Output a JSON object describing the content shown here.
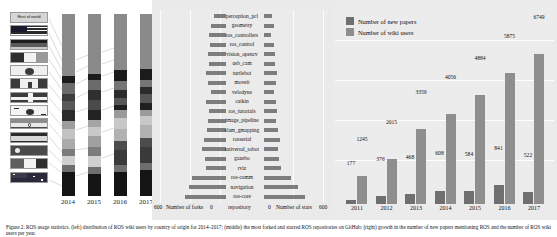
{
  "figure": {
    "caption": "Figure 2.    ROS usage statistics.    (left) distribution of ROS wiki users by country of origin for 2014–2017;    (middle) the most forked and starred ROS repositories on GitHub;    (right) growth in the number of new papers mentioning ROS and the number of ROS wiki users per year."
  },
  "panel_a": {
    "name": "country-distribution",
    "legend_label": "Rest of world",
    "years": [
      "2014",
      "2015",
      "2016",
      "2017"
    ],
    "flags": [
      "rest-of-world",
      "usa-flag",
      "germany-flag",
      "france-flag",
      "japan-flag",
      "canada-flag",
      "uk-flag",
      "south-korea-flag",
      "india-flag",
      "spain-flag",
      "china-flag",
      "italy-flag",
      "australia-flag"
    ],
    "chart_data": {
      "type": "bar",
      "title": "Distribution of ROS wiki users by country",
      "categories": [
        "2014",
        "2015",
        "2016",
        "2017"
      ],
      "xlabel": "",
      "ylabel": "share of users",
      "stacked": true,
      "series": [
        {
          "name": "Rest of world",
          "values": [
            34,
            33,
            31,
            30
          ]
        },
        {
          "name": "United States",
          "values": [
            4,
            3,
            6,
            6
          ]
        },
        {
          "name": "Germany",
          "values": [
            6,
            6,
            5,
            4
          ]
        },
        {
          "name": "France",
          "values": [
            4,
            5,
            4,
            4
          ]
        },
        {
          "name": "Japan",
          "values": [
            5,
            6,
            4,
            5
          ]
        },
        {
          "name": "Canada",
          "values": [
            6,
            5,
            3,
            4
          ]
        },
        {
          "name": "United Kingdom",
          "values": [
            4,
            4,
            4,
            3
          ]
        },
        {
          "name": "South Korea",
          "values": [
            6,
            5,
            6,
            5
          ]
        },
        {
          "name": "India",
          "values": [
            5,
            6,
            7,
            7
          ]
        },
        {
          "name": "Spain",
          "values": [
            4,
            5,
            5,
            5
          ]
        },
        {
          "name": "China",
          "values": [
            5,
            6,
            8,
            9
          ]
        },
        {
          "name": "Italy",
          "values": [
            4,
            4,
            4,
            4
          ]
        },
        {
          "name": "Australia",
          "values": [
            13,
            12,
            13,
            14
          ]
        }
      ]
    }
  },
  "panel_b": {
    "name": "repository-forks-stars",
    "axis_left_label": "Number of forks",
    "axis_center_label": "repository",
    "axis_right_label": "Number of stars",
    "axis_left_max": "600",
    "axis_left_min": "0",
    "axis_right_min": "0",
    "axis_right_max": "600",
    "chart_data": {
      "type": "bar",
      "title": "Most forked and starred ROS repositories on GitHub",
      "orientation": "horizontal-diverging",
      "xlabel_left": "Number of forks",
      "xlabel_right": "Number of stars",
      "ylabel": "repository",
      "xlim_left": [
        600,
        0
      ],
      "xlim_right": [
        0,
        600
      ],
      "categories": [
        "perception_pcl",
        "geometry",
        "ros_controllers",
        "ros_control",
        "vision_opencv",
        "usb_cam",
        "turtlebot",
        "moveit",
        "velodyne",
        "catkin",
        "ros_tutorials",
        "image_pipeline",
        "slam_gmapping",
        "rosserial",
        "universal_robot",
        "gazebo",
        "rviz",
        "ros-comm",
        "navigation",
        "ros-core"
      ],
      "series": [
        {
          "name": "Number of forks",
          "values": [
            120,
            148,
            168,
            152,
            170,
            160,
            196,
            176,
            148,
            196,
            166,
            174,
            182,
            214,
            230,
            200,
            196,
            330,
            360,
            400
          ]
        },
        {
          "name": "Number of stars",
          "values": [
            80,
            94,
            70,
            96,
            106,
            102,
            124,
            112,
            96,
            118,
            124,
            112,
            136,
            150,
            132,
            144,
            160,
            260,
            330,
            398
          ]
        }
      ]
    }
  },
  "panel_c": {
    "name": "papers-and-users-growth",
    "legend": [
      {
        "label": "Number of new papers",
        "color": "#6f6f6f"
      },
      {
        "label": "Number of wiki users",
        "color": "#8e8e8e"
      }
    ],
    "chart_data": {
      "type": "bar",
      "title": "Growth of ROS papers and wiki users",
      "categories": [
        "2011",
        "2012",
        "2013",
        "2014",
        "2015",
        "2016",
        "2017"
      ],
      "xlabel": "",
      "ylabel": "count",
      "ylim": [
        0,
        7200
      ],
      "series": [
        {
          "name": "Number of new papers",
          "color": "#6f6f6f",
          "values": [
            177,
            376,
            468,
            608,
            584,
            841,
            522
          ]
        },
        {
          "name": "Number of wiki users",
          "color": "#8e8e8e",
          "values": [
            1245,
            2015,
            3359,
            4056,
            4884,
            5875,
            6749
          ]
        }
      ],
      "data_labels": [
        "177",
        "1245",
        "376",
        "2015",
        "468",
        "3359",
        "608",
        "4056",
        "584",
        "4884",
        "841",
        "5875",
        "522",
        "6749"
      ]
    }
  }
}
